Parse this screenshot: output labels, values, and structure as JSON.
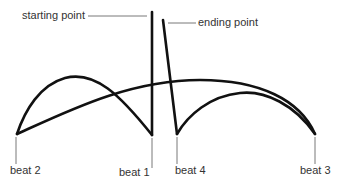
{
  "diagram": {
    "labels": {
      "start": "starting point",
      "end": "ending point",
      "beat1": "beat 1",
      "beat2": "beat 2",
      "beat3": "beat 3",
      "beat4": "beat 4"
    },
    "colors": {
      "stroke": "#111111",
      "leader": "#555555",
      "text": "#333333"
    }
  }
}
